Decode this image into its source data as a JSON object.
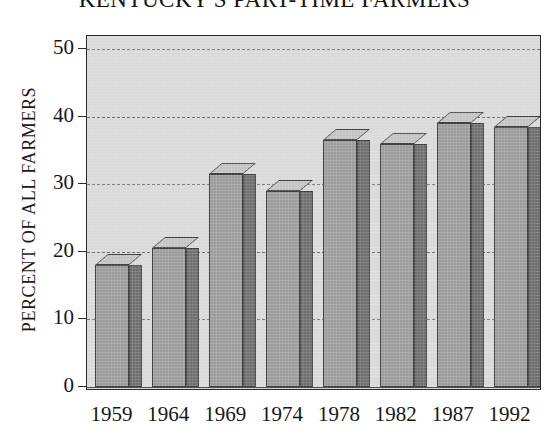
{
  "chart_data": {
    "type": "bar",
    "title": "KENTUCKY'S PART-TIME FARMERS",
    "xlabel": "",
    "ylabel": "PERCENT OF ALL FARMERS",
    "categories": [
      "1959",
      "1964",
      "1969",
      "1974",
      "1978",
      "1982",
      "1987",
      "1992"
    ],
    "values": [
      18,
      20.5,
      31.5,
      29,
      36.5,
      36,
      39,
      38.5
    ],
    "ylim": [
      0,
      50
    ],
    "yticks": [
      0,
      10,
      20,
      30,
      40,
      50
    ],
    "ytick_labels": [
      "0",
      "10",
      "20",
      "30",
      "40",
      "50"
    ],
    "grid": true,
    "legend": "none",
    "style": "3d-bar",
    "colors": {
      "bar_front": "#9c9c9c",
      "bar_side": "#6e6e6e",
      "bar_top": "#c3c3c3",
      "plot_background": "#d9d9d9",
      "axis": "#2b2b2b",
      "gridline": "#6d6d6d",
      "text": "#161616"
    }
  }
}
